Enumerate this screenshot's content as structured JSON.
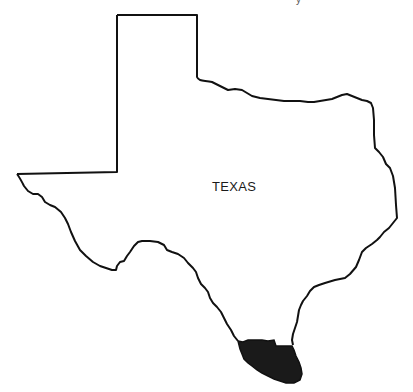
{
  "map": {
    "title_fragment": "y",
    "state_label": "TEXAS",
    "highlighted_region": "south-tip-lower-rio-grande-valley",
    "colors": {
      "outline": "#111111",
      "highlight_fill": "#1a1a1a",
      "background": "#ffffff"
    }
  }
}
